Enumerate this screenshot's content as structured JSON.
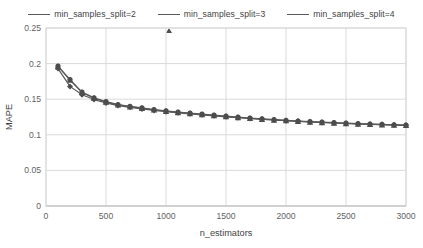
{
  "chart_data": {
    "type": "line",
    "title": "",
    "xlabel": "n_estimators",
    "ylabel": "MAPE",
    "xlim": [
      0,
      3000
    ],
    "ylim": [
      0,
      0.25
    ],
    "xticks": [
      "0",
      "500",
      "1000",
      "1500",
      "2000",
      "2500",
      "3000"
    ],
    "xtick_values": [
      0,
      500,
      1000,
      1500,
      2000,
      2500,
      3000
    ],
    "yticks": [
      "0",
      "0.05",
      "0.1",
      "0.15",
      "0.2",
      "0.25"
    ],
    "ytick_values": [
      0,
      0.05,
      0.1,
      0.15,
      0.2,
      0.25
    ],
    "grid": "horizontal-and-vertical",
    "legend_position": "top-center",
    "line_color": "#595959",
    "grid_color": "#d9d9d9",
    "x": [
      100,
      200,
      300,
      400,
      500,
      600,
      700,
      800,
      900,
      1000,
      1100,
      1200,
      1300,
      1400,
      1500,
      1600,
      1700,
      1800,
      1900,
      2000,
      2100,
      2200,
      2300,
      2400,
      2500,
      2600,
      2700,
      2800,
      2900,
      3000
    ],
    "series": [
      {
        "name": "min_samples_split=2",
        "marker": "circle",
        "values": [
          0.1965,
          0.1775,
          0.16,
          0.152,
          0.1465,
          0.1425,
          0.14,
          0.1378,
          0.1355,
          0.1337,
          0.132,
          0.1305,
          0.129,
          0.1275,
          0.1262,
          0.1248,
          0.1236,
          0.1224,
          0.1214,
          0.1204,
          0.1194,
          0.1186,
          0.1178,
          0.117,
          0.1163,
          0.1157,
          0.1151,
          0.1146,
          0.1141,
          0.1136
        ]
      },
      {
        "name": "min_samples_split=3",
        "marker": "triangle",
        "values": [
          0.196,
          0.177,
          0.1596,
          0.1515,
          0.146,
          0.142,
          0.1395,
          0.1372,
          0.135,
          0.1331,
          0.1314,
          0.1299,
          0.1284,
          0.127,
          0.1256,
          0.1243,
          0.1231,
          0.1219,
          0.1209,
          0.1199,
          0.119,
          0.1181,
          0.1173,
          0.1166,
          0.1159,
          0.1153,
          0.1147,
          0.1142,
          0.1137,
          0.1132
        ]
      },
      {
        "name": "min_samples_split=4",
        "marker": "diamond",
        "values": [
          0.193,
          0.168,
          0.1562,
          0.1495,
          0.1448,
          0.141,
          0.1386,
          0.1364,
          0.1343,
          0.1325,
          0.1309,
          0.1294,
          0.128,
          0.1266,
          0.1253,
          0.124,
          0.1229,
          0.1218,
          0.1208,
          0.1198,
          0.1189,
          0.1181,
          0.1173,
          0.1166,
          0.1159,
          0.1153,
          0.1148,
          0.1143,
          0.1138,
          0.1133
        ]
      }
    ]
  },
  "legend": {
    "items": [
      {
        "label": "min_samples_split=2",
        "marker": "circle"
      },
      {
        "label": "min_samples_split=3",
        "marker": "triangle"
      },
      {
        "label": "min_samples_split=4",
        "marker": "diamond"
      }
    ]
  }
}
